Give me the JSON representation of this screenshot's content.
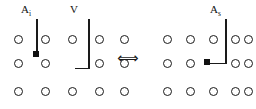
{
  "figure": {
    "title": "",
    "background_color": "#ffffff",
    "site_color": "#1a1a1a",
    "adatom_color": "#111111",
    "bond_color": "#1a1a1a"
  },
  "labels": {
    "left_adsorbate": "A",
    "left_adsorbate_sub": "i",
    "vacancy": "V",
    "right_adsorbate": "A",
    "right_adsorbate_sub": "s",
    "equivalence_arrow": "⟺"
  },
  "left_panel": {
    "name": "interstitial-configuration",
    "lattice": {
      "rows": 3,
      "cols": 5,
      "site_label": "lattice-site",
      "x_positions": [
        14,
        41,
        68,
        95,
        122
      ],
      "y_positions": [
        39,
        62,
        90
      ]
    },
    "adatom": {
      "label": "adatom-marker",
      "x": 33,
      "y": 53
    },
    "pointer_adsorbate": {
      "label": "adsorbate-pointer-line",
      "x": 36,
      "y_top": 19,
      "y_bottom": 53
    },
    "pointer_vacancy": {
      "label": "vacancy-pointer-line",
      "x": 88,
      "y_top": 19,
      "y_bottom": 68,
      "hook_x_left": 75,
      "hook_y": 68
    }
  },
  "right_panel": {
    "name": "substitutional-configuration",
    "lattice": {
      "rows": 3,
      "cols": 5,
      "site_label": "lattice-site",
      "x_positions": [
        166,
        188,
        210,
        232,
        248
      ],
      "y_positions": [
        39,
        62,
        90
      ]
    },
    "adatom": {
      "label": "adatom-marker",
      "x": 204,
      "y": 60
    },
    "pointer_adsorbate": {
      "label": "adsorbate-pointer-line",
      "x": 225,
      "y_top": 19,
      "y_bottom": 63,
      "hook_x_left": 210,
      "hook_y": 63
    }
  },
  "arrow": {
    "x": 119,
    "y": 52
  }
}
